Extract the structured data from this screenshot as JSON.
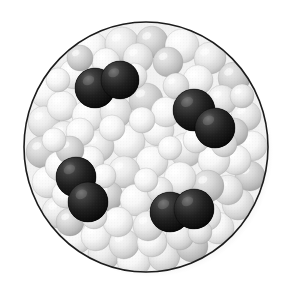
{
  "figure": {
    "title": "",
    "caption": "",
    "type": "space-filling-molecular-model",
    "background_color": "#ffffff"
  },
  "container": {
    "shape": "circle",
    "center_x": 146,
    "center_y": 147,
    "radius_x": 122,
    "radius_y": 125,
    "outline_color": "#1b1b1b",
    "outline_width": 1.6,
    "fill_color": "#f2f2f2",
    "shadow_color": "#d8d8d8",
    "shadow_offset_x": 5,
    "shadow_offset_y": 5
  },
  "palette": {
    "dark_sphere": "#1e1e1e",
    "dark_sphere_highlight": "#6a6a6a",
    "dark_sphere_shadow": "#050505",
    "white_sphere": "#fdfdfd",
    "white_sphere_shadow": "#c9c9c9",
    "light_gray_sphere": "#e2e2e2",
    "mid_gray_sphere": "#c4c4c4",
    "dark_gray_sphere": "#a8a8a8",
    "sphere_outline": "#9a9a9a"
  },
  "legend": {
    "dark_label": "",
    "light_label": ""
  },
  "chart_data": {
    "type": "scatter",
    "title": "",
    "xlabel": "",
    "ylabel": "",
    "counts": {
      "dark_molecules": 4,
      "dark_atoms": 8,
      "light_spheres": 78
    },
    "dark_molecules": [
      {
        "id": "molecule-1",
        "label": "",
        "atoms": [
          {
            "cx": 95,
            "cy": 88,
            "r": 20,
            "shade": "dark"
          },
          {
            "cx": 120,
            "cy": 80,
            "r": 19,
            "shade": "dark"
          }
        ]
      },
      {
        "id": "molecule-2",
        "label": "",
        "atoms": [
          {
            "cx": 194,
            "cy": 110,
            "r": 21,
            "shade": "dark"
          },
          {
            "cx": 215,
            "cy": 128,
            "r": 20,
            "shade": "dark"
          }
        ]
      },
      {
        "id": "molecule-3",
        "label": "",
        "atoms": [
          {
            "cx": 76,
            "cy": 177,
            "r": 20,
            "shade": "dark"
          },
          {
            "cx": 88,
            "cy": 202,
            "r": 20,
            "shade": "dark"
          }
        ]
      },
      {
        "id": "molecule-4",
        "label": "",
        "atoms": [
          {
            "cx": 170,
            "cy": 212,
            "r": 20,
            "shade": "dark"
          },
          {
            "cx": 194,
            "cy": 209,
            "r": 20,
            "shade": "dark"
          }
        ]
      }
    ],
    "light_spheres": [
      {
        "cx": 62,
        "cy": 62,
        "r": 17,
        "shade": "light_gray"
      },
      {
        "cx": 92,
        "cy": 48,
        "r": 16,
        "shade": "white"
      },
      {
        "cx": 122,
        "cy": 44,
        "r": 17,
        "shade": "light_gray"
      },
      {
        "cx": 152,
        "cy": 42,
        "r": 16,
        "shade": "mid_gray"
      },
      {
        "cx": 182,
        "cy": 46,
        "r": 17,
        "shade": "white"
      },
      {
        "cx": 210,
        "cy": 58,
        "r": 16,
        "shade": "light_gray"
      },
      {
        "cx": 234,
        "cy": 78,
        "r": 16,
        "shade": "mid_gray"
      },
      {
        "cx": 46,
        "cy": 92,
        "r": 16,
        "shade": "white"
      },
      {
        "cx": 44,
        "cy": 122,
        "r": 16,
        "shade": "light_gray"
      },
      {
        "cx": 42,
        "cy": 152,
        "r": 16,
        "shade": "mid_gray"
      },
      {
        "cx": 48,
        "cy": 182,
        "r": 16,
        "shade": "white"
      },
      {
        "cx": 58,
        "cy": 212,
        "r": 16,
        "shade": "light_gray"
      },
      {
        "cx": 76,
        "cy": 238,
        "r": 16,
        "shade": "white"
      },
      {
        "cx": 104,
        "cy": 254,
        "r": 16,
        "shade": "light_gray"
      },
      {
        "cx": 134,
        "cy": 260,
        "r": 17,
        "shade": "white"
      },
      {
        "cx": 164,
        "cy": 256,
        "r": 16,
        "shade": "light_gray"
      },
      {
        "cx": 192,
        "cy": 246,
        "r": 16,
        "shade": "mid_gray"
      },
      {
        "cx": 218,
        "cy": 228,
        "r": 16,
        "shade": "white"
      },
      {
        "cx": 238,
        "cy": 204,
        "r": 16,
        "shade": "light_gray"
      },
      {
        "cx": 250,
        "cy": 176,
        "r": 15,
        "shade": "mid_gray"
      },
      {
        "cx": 252,
        "cy": 146,
        "r": 15,
        "shade": "white"
      },
      {
        "cx": 246,
        "cy": 116,
        "r": 15,
        "shade": "light_gray"
      },
      {
        "cx": 74,
        "cy": 74,
        "r": 15,
        "shade": "white"
      },
      {
        "cx": 106,
        "cy": 62,
        "r": 14,
        "shade": "white"
      },
      {
        "cx": 138,
        "cy": 58,
        "r": 15,
        "shade": "light_gray"
      },
      {
        "cx": 168,
        "cy": 62,
        "r": 15,
        "shade": "mid_gray"
      },
      {
        "cx": 198,
        "cy": 80,
        "r": 15,
        "shade": "white"
      },
      {
        "cx": 222,
        "cy": 100,
        "r": 15,
        "shade": "light_gray"
      },
      {
        "cx": 62,
        "cy": 106,
        "r": 15,
        "shade": "white"
      },
      {
        "cx": 64,
        "cy": 136,
        "r": 15,
        "shade": "light_gray"
      },
      {
        "cx": 60,
        "cy": 166,
        "r": 15,
        "shade": "white"
      },
      {
        "cx": 70,
        "cy": 222,
        "r": 14,
        "shade": "mid_gray"
      },
      {
        "cx": 96,
        "cy": 236,
        "r": 15,
        "shade": "white"
      },
      {
        "cx": 124,
        "cy": 244,
        "r": 15,
        "shade": "light_gray"
      },
      {
        "cx": 152,
        "cy": 242,
        "r": 15,
        "shade": "white"
      },
      {
        "cx": 180,
        "cy": 236,
        "r": 14,
        "shade": "light_gray"
      },
      {
        "cx": 206,
        "cy": 216,
        "r": 15,
        "shade": "white"
      },
      {
        "cx": 228,
        "cy": 190,
        "r": 15,
        "shade": "light_gray"
      },
      {
        "cx": 236,
        "cy": 160,
        "r": 15,
        "shade": "white"
      },
      {
        "cx": 234,
        "cy": 132,
        "r": 14,
        "shade": "mid_gray"
      },
      {
        "cx": 88,
        "cy": 116,
        "r": 16,
        "shade": "white"
      },
      {
        "cx": 116,
        "cy": 112,
        "r": 16,
        "shade": "light_gray"
      },
      {
        "cx": 146,
        "cy": 100,
        "r": 17,
        "shade": "mid_gray"
      },
      {
        "cx": 158,
        "cy": 130,
        "r": 16,
        "shade": "white"
      },
      {
        "cx": 128,
        "cy": 142,
        "r": 17,
        "shade": "white"
      },
      {
        "cx": 98,
        "cy": 146,
        "r": 16,
        "shade": "light_gray"
      },
      {
        "cx": 80,
        "cy": 132,
        "r": 14,
        "shade": "white"
      },
      {
        "cx": 186,
        "cy": 150,
        "r": 17,
        "shade": "light_gray"
      },
      {
        "cx": 214,
        "cy": 160,
        "r": 16,
        "shade": "white"
      },
      {
        "cx": 208,
        "cy": 186,
        "r": 16,
        "shade": "mid_gray"
      },
      {
        "cx": 180,
        "cy": 178,
        "r": 16,
        "shade": "white"
      },
      {
        "cx": 152,
        "cy": 162,
        "r": 16,
        "shade": "white"
      },
      {
        "cx": 124,
        "cy": 172,
        "r": 16,
        "shade": "light_gray"
      },
      {
        "cx": 108,
        "cy": 196,
        "r": 15,
        "shade": "mid_gray"
      },
      {
        "cx": 136,
        "cy": 200,
        "r": 16,
        "shade": "white"
      },
      {
        "cx": 148,
        "cy": 226,
        "r": 15,
        "shade": "light_gray"
      },
      {
        "cx": 118,
        "cy": 222,
        "r": 15,
        "shade": "white"
      },
      {
        "cx": 90,
        "cy": 160,
        "r": 14,
        "shade": "white"
      },
      {
        "cx": 70,
        "cy": 150,
        "r": 14,
        "shade": "mid_gray"
      },
      {
        "cx": 166,
        "cy": 112,
        "r": 15,
        "shade": "white"
      },
      {
        "cx": 196,
        "cy": 140,
        "r": 13,
        "shade": "white"
      },
      {
        "cx": 224,
        "cy": 144,
        "r": 13,
        "shade": "light_gray"
      },
      {
        "cx": 112,
        "cy": 128,
        "r": 13,
        "shade": "white"
      },
      {
        "cx": 142,
        "cy": 120,
        "r": 13,
        "shade": "white"
      },
      {
        "cx": 66,
        "cy": 194,
        "r": 14,
        "shade": "white"
      },
      {
        "cx": 94,
        "cy": 216,
        "r": 13,
        "shade": "white"
      },
      {
        "cx": 160,
        "cy": 190,
        "r": 13,
        "shade": "light_gray"
      },
      {
        "cx": 216,
        "cy": 120,
        "r": 12,
        "shade": "white"
      },
      {
        "cx": 80,
        "cy": 58,
        "r": 13,
        "shade": "mid_gray"
      },
      {
        "cx": 134,
        "cy": 76,
        "r": 13,
        "shade": "white"
      },
      {
        "cx": 176,
        "cy": 86,
        "r": 13,
        "shade": "light_gray"
      },
      {
        "cx": 54,
        "cy": 140,
        "r": 12,
        "shade": "white"
      },
      {
        "cx": 104,
        "cy": 176,
        "r": 12,
        "shade": "white"
      },
      {
        "cx": 200,
        "cy": 232,
        "r": 12,
        "shade": "light_gray"
      },
      {
        "cx": 146,
        "cy": 180,
        "r": 12,
        "shade": "white"
      },
      {
        "cx": 170,
        "cy": 148,
        "r": 12,
        "shade": "white"
      },
      {
        "cx": 242,
        "cy": 96,
        "r": 12,
        "shade": "light_gray"
      },
      {
        "cx": 58,
        "cy": 80,
        "r": 12,
        "shade": "white"
      }
    ]
  }
}
